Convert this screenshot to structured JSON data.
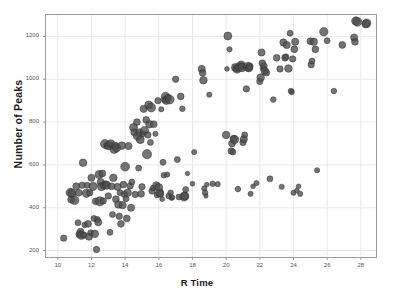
{
  "chart_data": {
    "type": "scatter",
    "title": "",
    "xlabel": "R Time",
    "ylabel": "Number of Peaks",
    "xlim": [
      9.3,
      28.9
    ],
    "ylim": [
      170,
      1300
    ],
    "xticks": [
      10,
      12,
      14,
      16,
      18,
      20,
      22,
      24,
      26,
      28
    ],
    "yticks": [
      200,
      400,
      600,
      800,
      1000,
      1200
    ],
    "grid": true,
    "legend": null,
    "marker": {
      "color": "#4d4d4d",
      "edge_color": "#2e2e2e",
      "opacity": 0.78,
      "size_encodes": "third variable (bubble size)",
      "min_radius_px": 1.2,
      "max_radius_px": 4.6
    },
    "points": [
      [
        10.35,
        258,
        3.2
      ],
      [
        10.75,
        470,
        4.4
      ],
      [
        10.8,
        438,
        3.6
      ],
      [
        10.85,
        468,
        4.0
      ],
      [
        11.0,
        435,
        4.3
      ],
      [
        11.1,
        500,
        3.5
      ],
      [
        11.2,
        330,
        3.0
      ],
      [
        11.25,
        470,
        3.4
      ],
      [
        11.3,
        276,
        3.8
      ],
      [
        11.35,
        288,
        3.4
      ],
      [
        11.4,
        272,
        4.2
      ],
      [
        11.45,
        505,
        3.2
      ],
      [
        11.5,
        610,
        3.8
      ],
      [
        11.55,
        272,
        3.2
      ],
      [
        11.6,
        320,
        2.8
      ],
      [
        11.7,
        468,
        4.2
      ],
      [
        11.75,
        505,
        3.0
      ],
      [
        11.8,
        325,
        3.4
      ],
      [
        11.85,
        265,
        3.6
      ],
      [
        11.9,
        470,
        3.2
      ],
      [
        11.95,
        283,
        3.0
      ],
      [
        12.0,
        540,
        3.6
      ],
      [
        12.1,
        500,
        4.2
      ],
      [
        12.15,
        350,
        3.0
      ],
      [
        12.2,
        278,
        3.8
      ],
      [
        12.25,
        430,
        3.4
      ],
      [
        12.3,
        205,
        3.2
      ],
      [
        12.35,
        345,
        3.0
      ],
      [
        12.4,
        332,
        3.6
      ],
      [
        12.45,
        555,
        4.0
      ],
      [
        12.5,
        430,
        4.6
      ],
      [
        12.55,
        520,
        3.6
      ],
      [
        12.6,
        498,
        4.0
      ],
      [
        12.65,
        560,
        3.4
      ],
      [
        12.7,
        432,
        3.2
      ],
      [
        12.75,
        505,
        3.6
      ],
      [
        12.8,
        698,
        4.4
      ],
      [
        12.85,
        512,
        3.0
      ],
      [
        12.9,
        505,
        4.0
      ],
      [
        12.95,
        690,
        3.6
      ],
      [
        13.0,
        455,
        3.2
      ],
      [
        13.05,
        690,
        4.2
      ],
      [
        13.1,
        285,
        3.0
      ],
      [
        13.15,
        700,
        3.8
      ],
      [
        13.2,
        500,
        3.4
      ],
      [
        13.25,
        368,
        3.0
      ],
      [
        13.3,
        540,
        3.8
      ],
      [
        13.35,
        672,
        4.0
      ],
      [
        13.4,
        690,
        3.6
      ],
      [
        13.45,
        440,
        3.4
      ],
      [
        13.5,
        680,
        4.2
      ],
      [
        13.55,
        497,
        3.6
      ],
      [
        13.6,
        415,
        3.8
      ],
      [
        13.65,
        360,
        3.2
      ],
      [
        13.7,
        470,
        3.0
      ],
      [
        13.75,
        325,
        3.4
      ],
      [
        13.8,
        690,
        3.8
      ],
      [
        13.85,
        412,
        3.6
      ],
      [
        13.9,
        508,
        3.4
      ],
      [
        13.95,
        463,
        3.2
      ],
      [
        14.0,
        592,
        4.4
      ],
      [
        14.05,
        442,
        3.0
      ],
      [
        14.1,
        350,
        3.4
      ],
      [
        14.15,
        470,
        3.8
      ],
      [
        14.2,
        688,
        3.6
      ],
      [
        14.3,
        502,
        3.2
      ],
      [
        14.35,
        400,
        3.6
      ],
      [
        14.4,
        520,
        3.0
      ],
      [
        14.5,
        775,
        4.0
      ],
      [
        14.55,
        752,
        3.6
      ],
      [
        14.6,
        462,
        3.2
      ],
      [
        14.7,
        800,
        3.4
      ],
      [
        14.75,
        735,
        4.4
      ],
      [
        14.8,
        585,
        3.0
      ],
      [
        14.85,
        752,
        3.6
      ],
      [
        14.9,
        718,
        4.0
      ],
      [
        14.95,
        465,
        3.4
      ],
      [
        15.0,
        498,
        3.2
      ],
      [
        15.05,
        745,
        3.0
      ],
      [
        15.1,
        862,
        3.6
      ],
      [
        15.15,
        760,
        4.2
      ],
      [
        15.25,
        810,
        3.4
      ],
      [
        15.3,
        650,
        4.6
      ],
      [
        15.35,
        740,
        3.2
      ],
      [
        15.4,
        880,
        4.0
      ],
      [
        15.45,
        790,
        3.8
      ],
      [
        15.5,
        705,
        3.0
      ],
      [
        15.55,
        868,
        4.4
      ],
      [
        15.6,
        478,
        3.2
      ],
      [
        15.65,
        492,
        2.8
      ],
      [
        15.7,
        790,
        3.4
      ],
      [
        15.8,
        745,
        2.6
      ],
      [
        15.85,
        505,
        3.6
      ],
      [
        15.9,
        460,
        3.0
      ],
      [
        15.95,
        900,
        3.2
      ],
      [
        16.0,
        495,
        3.8
      ],
      [
        16.05,
        470,
        4.0
      ],
      [
        16.1,
        465,
        3.4
      ],
      [
        16.15,
        860,
        2.6
      ],
      [
        16.2,
        440,
        2.4
      ],
      [
        16.25,
        612,
        3.0
      ],
      [
        16.3,
        552,
        2.8
      ],
      [
        16.35,
        905,
        3.4
      ],
      [
        16.4,
        920,
        4.2
      ],
      [
        16.45,
        900,
        3.8
      ],
      [
        16.5,
        555,
        2.6
      ],
      [
        16.55,
        915,
        3.2
      ],
      [
        16.6,
        455,
        3.0
      ],
      [
        16.65,
        905,
        4.4
      ],
      [
        16.7,
        470,
        2.8
      ],
      [
        16.75,
        445,
        2.4
      ],
      [
        16.8,
        448,
        2.6
      ],
      [
        17.0,
        1000,
        3.2
      ],
      [
        17.1,
        625,
        3.0
      ],
      [
        17.2,
        450,
        3.0
      ],
      [
        17.3,
        920,
        3.4
      ],
      [
        17.4,
        862,
        2.8
      ],
      [
        17.5,
        452,
        4.4
      ],
      [
        17.55,
        455,
        4.0
      ],
      [
        17.6,
        485,
        3.0
      ],
      [
        17.7,
        560,
        2.2
      ],
      [
        18.0,
        512,
        2.4
      ],
      [
        18.1,
        660,
        2.6
      ],
      [
        18.55,
        1048,
        3.6
      ],
      [
        18.6,
        1030,
        3.4
      ],
      [
        18.65,
        995,
        3.8
      ],
      [
        18.7,
        490,
        2.6
      ],
      [
        18.75,
        470,
        2.8
      ],
      [
        18.8,
        455,
        2.2
      ],
      [
        18.85,
        508,
        2.4
      ],
      [
        19.0,
        928,
        2.6
      ],
      [
        19.2,
        512,
        2.8
      ],
      [
        19.5,
        510,
        2.6
      ],
      [
        20.0,
        740,
        3.8
      ],
      [
        20.05,
        1048,
        2.4
      ],
      [
        20.1,
        1202,
        4.0
      ],
      [
        20.2,
        1140,
        2.6
      ],
      [
        20.3,
        665,
        3.2
      ],
      [
        20.35,
        700,
        3.4
      ],
      [
        20.4,
        660,
        3.0
      ],
      [
        20.45,
        722,
        3.6
      ],
      [
        20.5,
        718,
        4.2
      ],
      [
        20.55,
        1055,
        4.0
      ],
      [
        20.6,
        1050,
        3.4
      ],
      [
        20.65,
        1045,
        3.6
      ],
      [
        20.7,
        487,
        2.8
      ],
      [
        20.8,
        1058,
        4.4
      ],
      [
        20.9,
        1068,
        3.8
      ],
      [
        20.95,
        1055,
        4.2
      ],
      [
        21.0,
        705,
        3.2
      ],
      [
        21.05,
        720,
        3.6
      ],
      [
        21.1,
        740,
        3.0
      ],
      [
        21.2,
        955,
        3.2
      ],
      [
        21.3,
        1058,
        4.6
      ],
      [
        21.35,
        1052,
        3.8
      ],
      [
        21.4,
        1060,
        3.4
      ],
      [
        21.45,
        465,
        2.6
      ],
      [
        21.6,
        500,
        2.4
      ],
      [
        21.8,
        515,
        2.6
      ],
      [
        22.0,
        990,
        3.2
      ],
      [
        22.05,
        1008,
        3.8
      ],
      [
        22.1,
        1125,
        3.6
      ],
      [
        22.15,
        1075,
        3.4
      ],
      [
        22.2,
        1050,
        3.0
      ],
      [
        22.25,
        1062,
        3.2
      ],
      [
        22.3,
        1038,
        3.8
      ],
      [
        22.4,
        1030,
        3.2
      ],
      [
        22.6,
        535,
        3.0
      ],
      [
        22.8,
        905,
        2.8
      ],
      [
        23.0,
        1100,
        3.4
      ],
      [
        23.2,
        1048,
        3.2
      ],
      [
        23.3,
        498,
        2.6
      ],
      [
        23.4,
        1172,
        3.6
      ],
      [
        23.5,
        1100,
        3.4
      ],
      [
        23.55,
        1105,
        3.0
      ],
      [
        23.6,
        1160,
        3.6
      ],
      [
        23.7,
        1050,
        3.8
      ],
      [
        23.8,
        1215,
        3.0
      ],
      [
        23.85,
        945,
        2.8
      ],
      [
        23.9,
        940,
        2.6
      ],
      [
        23.95,
        1095,
        3.2
      ],
      [
        24.0,
        470,
        2.6
      ],
      [
        24.05,
        1140,
        3.4
      ],
      [
        24.1,
        1175,
        3.6
      ],
      [
        24.2,
        480,
        2.4
      ],
      [
        24.3,
        500,
        2.4
      ],
      [
        24.4,
        465,
        2.6
      ],
      [
        25.0,
        1178,
        3.4
      ],
      [
        25.05,
        1068,
        3.2
      ],
      [
        25.1,
        1085,
        3.0
      ],
      [
        25.2,
        1175,
        3.8
      ],
      [
        25.3,
        1140,
        3.4
      ],
      [
        25.4,
        575,
        2.6
      ],
      [
        25.8,
        1222,
        4.2
      ],
      [
        26.0,
        1180,
        3.0
      ],
      [
        26.4,
        945,
        2.8
      ],
      [
        26.9,
        1160,
        3.4
      ],
      [
        27.6,
        1195,
        3.6
      ],
      [
        27.65,
        1175,
        3.4
      ],
      [
        27.7,
        1272,
        4.2
      ],
      [
        27.8,
        1268,
        4.4
      ],
      [
        28.3,
        1258,
        4.0
      ],
      [
        28.35,
        1262,
        4.2
      ]
    ]
  },
  "axes": {
    "xlabel": "R Time",
    "ylabel": "Number of Peaks",
    "xtick_labels": [
      "10",
      "12",
      "14",
      "16",
      "18",
      "20",
      "22",
      "24",
      "26",
      "28"
    ],
    "ytick_labels": [
      "200",
      "400",
      "600",
      "800",
      "1000",
      "1200"
    ]
  },
  "colors": {
    "marker_fill": "#4d4d4d",
    "marker_edge": "#2f2f2f",
    "grid": "#e9e9ec",
    "frame": "#9a9a9a",
    "background": "#ffffff",
    "text": "#555555",
    "label_text": "#1c1c1c"
  }
}
